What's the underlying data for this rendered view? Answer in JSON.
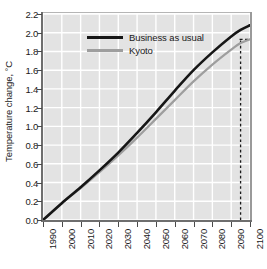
{
  "chart_data": {
    "type": "line",
    "title": "",
    "xlabel": "",
    "ylabel": "Temperature change, °C",
    "xlim": [
      1990,
      2100
    ],
    "ylim": [
      0.0,
      2.2
    ],
    "grid": true,
    "legend_position": "upper-left-inside",
    "xticks": [
      "1990",
      "2000",
      "2010",
      "2020",
      "2030",
      "2040",
      "2050",
      "2060",
      "2070",
      "2080",
      "2090",
      "2100"
    ],
    "yticks": [
      "0.0",
      "0.2",
      "0.4",
      "0.6",
      "0.8",
      "1.0",
      "1.2",
      "1.4",
      "1.6",
      "1.8",
      "2.0",
      "2.2"
    ],
    "x": [
      1990,
      2000,
      2010,
      2020,
      2030,
      2040,
      2050,
      2060,
      2070,
      2080,
      2090,
      2095,
      2100
    ],
    "series": [
      {
        "name": "Business as usual",
        "color": "#161616",
        "values": [
          0.0,
          0.18,
          0.35,
          0.53,
          0.72,
          0.93,
          1.15,
          1.38,
          1.6,
          1.79,
          1.96,
          2.03,
          2.08
        ]
      },
      {
        "name": "Kyoto",
        "color": "#9e9e9e",
        "values": [
          0.0,
          0.18,
          0.34,
          0.51,
          0.69,
          0.88,
          1.08,
          1.28,
          1.48,
          1.66,
          1.82,
          1.89,
          1.93
        ]
      }
    ],
    "annotations": [
      {
        "name": "reference-dashed-vertical",
        "type": "vline",
        "x": 2095,
        "style": "dashed",
        "color": "#1a1a1a",
        "y_from": 0.0,
        "y_to": 1.93
      },
      {
        "name": "reference-dashed-horizontal",
        "type": "hline-tick",
        "y": 1.93,
        "style": "dashed",
        "color": "#1a1a1a"
      }
    ],
    "colors": {
      "plot_background": "#e3e3e3",
      "gridlines": "#ffffff",
      "axis": "#6e6e6e",
      "text": "#1a1a1a"
    }
  },
  "legend": {
    "items": [
      {
        "label": "Business as usual",
        "color": "#161616"
      },
      {
        "label": "Kyoto",
        "color": "#9e9e9e"
      }
    ]
  }
}
